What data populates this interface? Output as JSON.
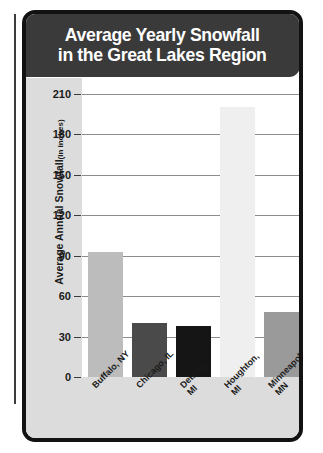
{
  "chart_data": {
    "type": "bar",
    "title": "Average Yearly Snowfall\nin the Great Lakes Region",
    "title_line1": "Average Yearly Snowfall",
    "title_line2": "in the Great Lakes Region",
    "xlabel": "",
    "ylabel": "Average Annual Snowfall",
    "ylabel_unit": "(in inches)",
    "ylim": [
      0,
      210
    ],
    "yticks": [
      0,
      30,
      60,
      90,
      120,
      150,
      180,
      210
    ],
    "grid": true,
    "legend": "none",
    "categories": [
      "Buffalo, NY",
      "Chicago, IL",
      "Detroit,\nMI",
      "Houghton,\nMI",
      "Minneapolis,\nMN"
    ],
    "values": [
      93,
      40,
      38,
      200,
      48
    ],
    "bar_colors": [
      "#bcbcbc",
      "#4a4a4a",
      "#151515",
      "#efefef",
      "#9a9a9a"
    ]
  },
  "style": {
    "banner_bg": "#3a3a3a",
    "banner_text": "#ffffff",
    "card_border": "#121212",
    "axis_strip_bg": "#dcdcdc",
    "plot_bg": "#ffffff",
    "gridline": "#8c8c8c",
    "tick_text": "#1a1a1a"
  }
}
